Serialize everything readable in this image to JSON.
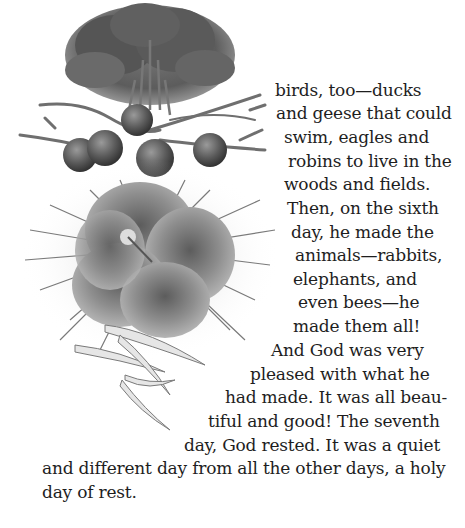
{
  "page": {
    "background": "#ffffff",
    "text_color": "#1e1e1e"
  },
  "illustration": {
    "description": "Grayscale drawing of a leafy tree above branches bearing round fruits, with a large hibiscus flower surrounded by grass blades and fallen leaves",
    "elements": [
      "tree",
      "branches",
      "fruits",
      "hibiscus-flower",
      "grass",
      "fallen-leaves"
    ],
    "fruit_count": 6
  },
  "body_text": {
    "lines": [
      {
        "text": "birds, too—ducks",
        "x": 275,
        "y": 80
      },
      {
        "text": "and geese that could",
        "x": 276,
        "y": 103
      },
      {
        "text": "swim, eagles and",
        "x": 284,
        "y": 127
      },
      {
        "text": "robins to live in the",
        "x": 288,
        "y": 151
      },
      {
        "text": "woods and fields.",
        "x": 284,
        "y": 174
      },
      {
        "text": "Then, on the sixth",
        "x": 287,
        "y": 198
      },
      {
        "text": "day, he made the",
        "x": 291,
        "y": 222
      },
      {
        "text": "animals—rabbits,",
        "x": 295,
        "y": 245
      },
      {
        "text": "elephants, and",
        "x": 293,
        "y": 269
      },
      {
        "text": "even bees—he",
        "x": 298,
        "y": 292
      },
      {
        "text": "made them all!",
        "x": 293,
        "y": 316
      },
      {
        "text": "And God was very",
        "x": 271,
        "y": 340
      },
      {
        "text": "pleased with what he",
        "x": 250,
        "y": 364
      },
      {
        "text": "had made. It was all beau-",
        "x": 225,
        "y": 387
      },
      {
        "text": "tiful and good! The seventh",
        "x": 208,
        "y": 411
      },
      {
        "text": "day, God rested. It was a quiet",
        "x": 184,
        "y": 435
      },
      {
        "text": "and different day from all the other days, a holy",
        "x": 42,
        "y": 458
      },
      {
        "text": "day of rest.",
        "x": 42,
        "y": 482
      }
    ]
  }
}
